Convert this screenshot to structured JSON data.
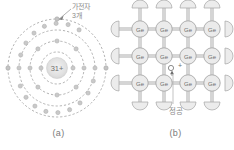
{
  "figure": {
    "type": "diagram",
    "background": "#ffffff",
    "line_color": "#9a9a9a",
    "text_color": "#8a8a8a",
    "atom_fill": "#e8e8e8"
  },
  "panel_a": {
    "caption": "(a)",
    "nucleus_label": "31+",
    "annotation": "가전자\n3개",
    "shell_count": 4,
    "shell_electron_counts": [
      2,
      8,
      18,
      3
    ],
    "description_icon": "bohr-atom-icon"
  },
  "panel_b": {
    "caption": "(b)",
    "atom_label": "Ge",
    "hole_label": "정공",
    "hole_marker": "+",
    "rows": 3,
    "columns": 4,
    "lattice": [
      [
        "Ge",
        "Ge",
        "Ge",
        "Ge"
      ],
      [
        "Ge",
        "Ge",
        "Ge",
        "Ge"
      ],
      [
        "Ge",
        "Ge",
        "Ge",
        "Ge"
      ]
    ],
    "description_icon": "crystal-lattice-icon"
  }
}
